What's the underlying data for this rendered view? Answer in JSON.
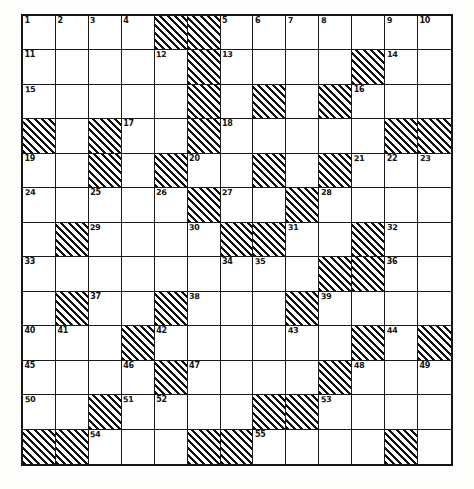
{
  "puzzle": {
    "type": "crossword-grid",
    "title": "",
    "rows": 12,
    "columns": 13,
    "ink_color": "#141414",
    "cell_background": "#ffffff",
    "block_style": "diagonal-hatch",
    "highest_clue_number": 55,
    "grid": [
      [
        {
          "block": false,
          "num": "1"
        },
        {
          "block": false,
          "num": "2"
        },
        {
          "block": false,
          "num": "3"
        },
        {
          "block": false,
          "num": "4"
        },
        {
          "block": true,
          "num": ""
        },
        {
          "block": true,
          "num": ""
        },
        {
          "block": false,
          "num": "5"
        },
        {
          "block": false,
          "num": "6"
        },
        {
          "block": false,
          "num": "7"
        },
        {
          "block": false,
          "num": "8"
        },
        {
          "block": false,
          "num": ""
        },
        {
          "block": false,
          "num": "9"
        },
        {
          "block": false,
          "num": "10"
        }
      ],
      [
        {
          "block": false,
          "num": "11"
        },
        {
          "block": false,
          "num": ""
        },
        {
          "block": false,
          "num": ""
        },
        {
          "block": false,
          "num": ""
        },
        {
          "block": false,
          "num": "12"
        },
        {
          "block": true,
          "num": ""
        },
        {
          "block": false,
          "num": "13"
        },
        {
          "block": false,
          "num": ""
        },
        {
          "block": false,
          "num": ""
        },
        {
          "block": false,
          "num": ""
        },
        {
          "block": true,
          "num": ""
        },
        {
          "block": false,
          "num": "14"
        },
        {
          "block": false,
          "num": ""
        }
      ],
      [
        {
          "block": false,
          "num": "15"
        },
        {
          "block": false,
          "num": ""
        },
        {
          "block": false,
          "num": ""
        },
        {
          "block": false,
          "num": ""
        },
        {
          "block": false,
          "num": ""
        },
        {
          "block": true,
          "num": ""
        },
        {
          "block": false,
          "num": ""
        },
        {
          "block": true,
          "num": ""
        },
        {
          "block": false,
          "num": ""
        },
        {
          "block": true,
          "num": ""
        },
        {
          "block": false,
          "num": "16"
        },
        {
          "block": false,
          "num": ""
        },
        {
          "block": false,
          "num": ""
        }
      ],
      [
        {
          "block": true,
          "num": ""
        },
        {
          "block": false,
          "num": ""
        },
        {
          "block": true,
          "num": ""
        },
        {
          "block": false,
          "num": "17"
        },
        {
          "block": false,
          "num": ""
        },
        {
          "block": true,
          "num": ""
        },
        {
          "block": false,
          "num": "18"
        },
        {
          "block": false,
          "num": ""
        },
        {
          "block": false,
          "num": ""
        },
        {
          "block": false,
          "num": ""
        },
        {
          "block": false,
          "num": ""
        },
        {
          "block": true,
          "num": ""
        },
        {
          "block": true,
          "num": ""
        }
      ],
      [
        {
          "block": false,
          "num": "19"
        },
        {
          "block": false,
          "num": ""
        },
        {
          "block": true,
          "num": ""
        },
        {
          "block": false,
          "num": ""
        },
        {
          "block": true,
          "num": ""
        },
        {
          "block": false,
          "num": "20"
        },
        {
          "block": false,
          "num": ""
        },
        {
          "block": true,
          "num": ""
        },
        {
          "block": false,
          "num": ""
        },
        {
          "block": true,
          "num": ""
        },
        {
          "block": false,
          "num": "21"
        },
        {
          "block": false,
          "num": "22"
        },
        {
          "block": false,
          "num": "23"
        }
      ],
      [
        {
          "block": false,
          "num": "24"
        },
        {
          "block": false,
          "num": ""
        },
        {
          "block": false,
          "num": "25"
        },
        {
          "block": false,
          "num": ""
        },
        {
          "block": false,
          "num": "26"
        },
        {
          "block": true,
          "num": ""
        },
        {
          "block": false,
          "num": "27"
        },
        {
          "block": false,
          "num": ""
        },
        {
          "block": true,
          "num": ""
        },
        {
          "block": false,
          "num": "28"
        },
        {
          "block": false,
          "num": ""
        },
        {
          "block": false,
          "num": ""
        },
        {
          "block": false,
          "num": ""
        }
      ],
      [
        {
          "block": false,
          "num": ""
        },
        {
          "block": true,
          "num": ""
        },
        {
          "block": false,
          "num": "29"
        },
        {
          "block": false,
          "num": ""
        },
        {
          "block": false,
          "num": ""
        },
        {
          "block": false,
          "num": "30"
        },
        {
          "block": true,
          "num": ""
        },
        {
          "block": true,
          "num": ""
        },
        {
          "block": false,
          "num": "31"
        },
        {
          "block": false,
          "num": ""
        },
        {
          "block": true,
          "num": ""
        },
        {
          "block": false,
          "num": "32"
        },
        {
          "block": false,
          "num": ""
        }
      ],
      [
        {
          "block": false,
          "num": "33"
        },
        {
          "block": false,
          "num": ""
        },
        {
          "block": false,
          "num": ""
        },
        {
          "block": false,
          "num": ""
        },
        {
          "block": false,
          "num": ""
        },
        {
          "block": false,
          "num": ""
        },
        {
          "block": false,
          "num": "34"
        },
        {
          "block": false,
          "num": "35"
        },
        {
          "block": false,
          "num": ""
        },
        {
          "block": true,
          "num": ""
        },
        {
          "block": true,
          "num": ""
        },
        {
          "block": false,
          "num": "36"
        },
        {
          "block": false,
          "num": ""
        }
      ],
      [
        {
          "block": false,
          "num": ""
        },
        {
          "block": true,
          "num": ""
        },
        {
          "block": false,
          "num": "37"
        },
        {
          "block": false,
          "num": ""
        },
        {
          "block": true,
          "num": ""
        },
        {
          "block": false,
          "num": "38"
        },
        {
          "block": false,
          "num": ""
        },
        {
          "block": false,
          "num": ""
        },
        {
          "block": true,
          "num": ""
        },
        {
          "block": false,
          "num": "39"
        },
        {
          "block": false,
          "num": ""
        },
        {
          "block": false,
          "num": ""
        },
        {
          "block": false,
          "num": ""
        }
      ],
      [
        {
          "block": false,
          "num": "40"
        },
        {
          "block": false,
          "num": "41"
        },
        {
          "block": false,
          "num": ""
        },
        {
          "block": true,
          "num": ""
        },
        {
          "block": false,
          "num": "42"
        },
        {
          "block": false,
          "num": ""
        },
        {
          "block": false,
          "num": ""
        },
        {
          "block": false,
          "num": ""
        },
        {
          "block": false,
          "num": "43"
        },
        {
          "block": false,
          "num": ""
        },
        {
          "block": true,
          "num": ""
        },
        {
          "block": false,
          "num": "44"
        },
        {
          "block": true,
          "num": ""
        }
      ],
      [
        {
          "block": false,
          "num": "45"
        },
        {
          "block": false,
          "num": ""
        },
        {
          "block": false,
          "num": ""
        },
        {
          "block": false,
          "num": "46"
        },
        {
          "block": true,
          "num": ""
        },
        {
          "block": false,
          "num": "47"
        },
        {
          "block": false,
          "num": ""
        },
        {
          "block": false,
          "num": ""
        },
        {
          "block": false,
          "num": ""
        },
        {
          "block": true,
          "num": ""
        },
        {
          "block": false,
          "num": "48"
        },
        {
          "block": false,
          "num": ""
        },
        {
          "block": false,
          "num": "49"
        }
      ],
      [
        {
          "block": false,
          "num": "50"
        },
        {
          "block": false,
          "num": ""
        },
        {
          "block": true,
          "num": ""
        },
        {
          "block": false,
          "num": "51"
        },
        {
          "block": false,
          "num": "52"
        },
        {
          "block": false,
          "num": ""
        },
        {
          "block": false,
          "num": ""
        },
        {
          "block": true,
          "num": ""
        },
        {
          "block": true,
          "num": ""
        },
        {
          "block": false,
          "num": "53"
        },
        {
          "block": false,
          "num": ""
        },
        {
          "block": false,
          "num": ""
        },
        {
          "block": false,
          "num": ""
        }
      ]
    ],
    "last_row": [
      {
        "block": true,
        "num": ""
      },
      {
        "block": true,
        "num": ""
      },
      {
        "block": false,
        "num": "54"
      },
      {
        "block": false,
        "num": ""
      },
      {
        "block": false,
        "num": ""
      },
      {
        "block": true,
        "num": ""
      },
      {
        "block": true,
        "num": ""
      },
      {
        "block": false,
        "num": "55"
      },
      {
        "block": false,
        "num": ""
      },
      {
        "block": false,
        "num": ""
      },
      {
        "block": false,
        "num": ""
      },
      {
        "block": true,
        "num": ""
      },
      {
        "block": false,
        "num": ""
      }
    ]
  }
}
